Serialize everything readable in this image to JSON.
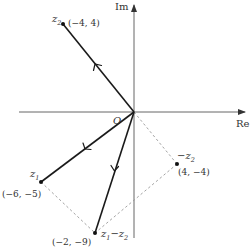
{
  "axes": {
    "x_label": "Re",
    "y_label": "Im",
    "origin_label": "O"
  },
  "points": [
    {
      "id": "z2",
      "name": "z",
      "sub": "2",
      "coord": "(-4, 4)",
      "x": -4,
      "y": 4
    },
    {
      "id": "z1",
      "name": "z",
      "sub": "1",
      "coord": "(-6, -5)",
      "x": -6,
      "y": -5
    },
    {
      "id": "z1_minus_z2",
      "name": "z",
      "sub": "1",
      "suffix": "−z",
      "sub2": "2",
      "coord": "(-2, -9)",
      "x": -2,
      "y": -9
    },
    {
      "id": "neg_z2",
      "prefix": "−z",
      "sub": "2",
      "coord": "(4, -4)",
      "x": 4,
      "y": -4
    }
  ],
  "vectors": [
    {
      "from": "O",
      "to": "z2",
      "style": "solid"
    },
    {
      "from": "O",
      "to": "z1",
      "style": "solid"
    },
    {
      "from": "O",
      "to": "z1_minus_z2",
      "style": "solid"
    }
  ],
  "dashed_lines": [
    {
      "from": "O",
      "to": "neg_z2"
    },
    {
      "from": "z1",
      "to": "z1_minus_z2"
    },
    {
      "from": "neg_z2",
      "to": "z1_minus_z2"
    }
  ],
  "labels": {
    "z2_coord": "(−4, 4)",
    "z1_coord": "(−6, −5)",
    "z1mz2_coord": "(−2, −9)",
    "negz2_coord": "(4, −4)"
  }
}
